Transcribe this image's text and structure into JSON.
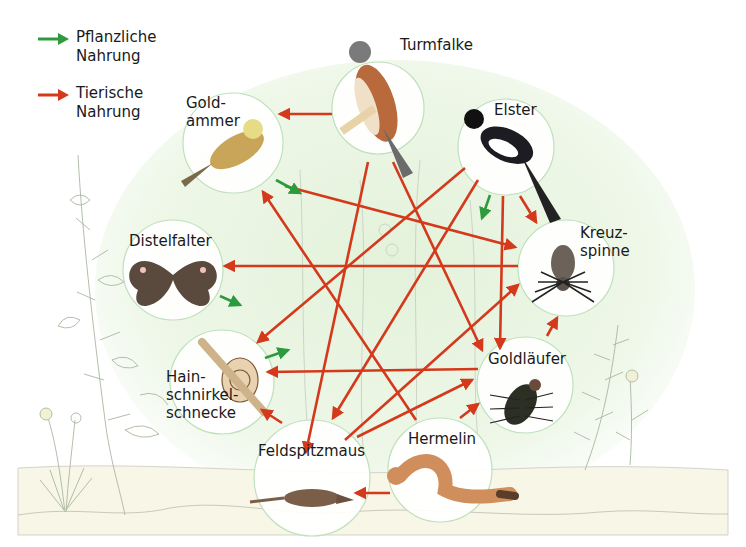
{
  "legend": [
    {
      "id": "plant",
      "label": "Pflanzliche\nNahrung",
      "color": "#2e9a3e"
    },
    {
      "id": "animal",
      "label": "Tierische\nNahrung",
      "color": "#d4391c"
    }
  ],
  "organisms": [
    {
      "id": "turmfalke",
      "label": "Turmfalke",
      "icon": "kestrel-icon"
    },
    {
      "id": "goldammer",
      "label": "Gold-\nammer",
      "icon": "yellowhammer-icon"
    },
    {
      "id": "elster",
      "label": "Elster",
      "icon": "magpie-icon"
    },
    {
      "id": "distelfalter",
      "label": "Distelfalter",
      "icon": "butterfly-icon"
    },
    {
      "id": "kreuzspinne",
      "label": "Kreuz-\nspinne",
      "icon": "spider-icon"
    },
    {
      "id": "schnecke",
      "label": "Hain-\nschnirkel-\nschnecke",
      "icon": "snail-icon"
    },
    {
      "id": "goldlaeufer",
      "label": "Goldläufer",
      "icon": "beetle-icon"
    },
    {
      "id": "feldspitzmaus",
      "label": "Feldspitzmaus",
      "icon": "shrew-icon"
    },
    {
      "id": "hermelin",
      "label": "Hermelin",
      "icon": "stoat-icon"
    }
  ],
  "links": [
    {
      "from": "turmfalke",
      "to": "goldammer",
      "type": "animal"
    },
    {
      "from": "goldammer",
      "to": "kreuzspinne",
      "type": "animal"
    },
    {
      "from": "kreuzspinne",
      "to": "distelfalter",
      "type": "animal"
    },
    {
      "from": "elster",
      "to": "schnecke",
      "type": "animal"
    },
    {
      "from": "turmfalke",
      "to": "feldspitzmaus",
      "type": "animal"
    },
    {
      "from": "turmfalke",
      "to": "goldlaeufer",
      "type": "animal"
    },
    {
      "from": "elster",
      "to": "feldspitzmaus",
      "type": "animal"
    },
    {
      "from": "elster",
      "to": "goldlaeufer",
      "type": "animal"
    },
    {
      "from": "elster",
      "to": "kreuzspinne",
      "type": "animal"
    },
    {
      "from": "hermelin",
      "to": "goldammer",
      "type": "animal"
    },
    {
      "from": "goldlaeufer",
      "to": "schnecke",
      "type": "animal"
    },
    {
      "from": "feldspitzmaus",
      "to": "kreuzspinne",
      "type": "animal"
    },
    {
      "from": "feldspitzmaus",
      "to": "goldlaeufer",
      "type": "animal"
    },
    {
      "from": "hermelin",
      "to": "goldlaeufer",
      "type": "animal"
    },
    {
      "from": "feldspitzmaus",
      "to": "schnecke",
      "type": "animal"
    },
    {
      "from": "goldlaeufer",
      "to": "kreuzspinne",
      "type": "animal"
    },
    {
      "from": "hermelin",
      "to": "feldspitzmaus",
      "type": "animal"
    },
    {
      "from": "goldammer",
      "to": "plants",
      "type": "plant"
    },
    {
      "from": "distelfalter",
      "to": "plants",
      "type": "plant"
    },
    {
      "from": "schnecke",
      "to": "plants",
      "type": "plant"
    },
    {
      "from": "elster",
      "to": "plants",
      "type": "plant"
    }
  ]
}
